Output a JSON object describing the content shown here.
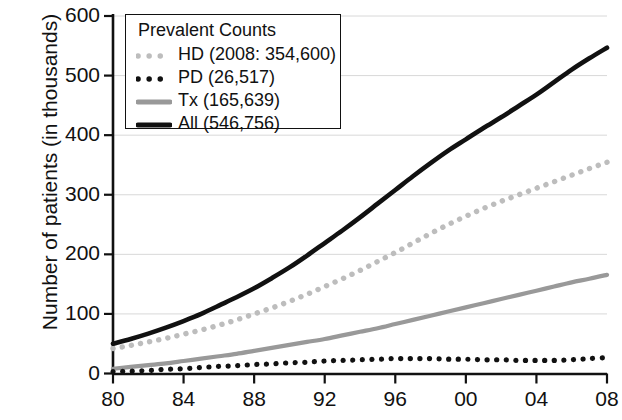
{
  "chart_data": {
    "type": "line",
    "title": "",
    "xlabel": "",
    "ylabel": "Number of patients (in thousands)",
    "xlim": [
      1980,
      2008
    ],
    "ylim": [
      0,
      600
    ],
    "xticks": [
      "80",
      "84",
      "88",
      "92",
      "96",
      "00",
      "04",
      "08"
    ],
    "xtick_values": [
      1980,
      1984,
      1988,
      1992,
      1996,
      2000,
      2004,
      2008
    ],
    "yticks": [
      "0",
      "100",
      "200",
      "300",
      "400",
      "500",
      "600"
    ],
    "ytick_values": [
      0,
      100,
      200,
      300,
      400,
      500,
      600
    ],
    "grid": "horizontal",
    "legend_position": "top-left",
    "legend_title": "Prevalent Counts",
    "x": [
      1980,
      1981,
      1982,
      1983,
      1984,
      1985,
      1986,
      1987,
      1988,
      1989,
      1990,
      1991,
      1992,
      1993,
      1994,
      1995,
      1996,
      1997,
      1998,
      1999,
      2000,
      2001,
      2002,
      2003,
      2004,
      2005,
      2006,
      2007,
      2008
    ],
    "series": [
      {
        "name": "HD",
        "label": "HD (2008: 354,600)",
        "style": "dotted",
        "color": "#bdbdbd",
        "final_value": 354.6,
        "values": [
          42,
          47,
          53,
          59,
          66,
          73,
          81,
          90,
          100,
          110,
          121,
          133,
          146,
          159,
          173,
          188,
          203,
          219,
          235,
          250,
          264,
          277,
          289,
          300,
          311,
          322,
          333,
          344,
          354.6
        ]
      },
      {
        "name": "PD",
        "label": "PD (26,517)",
        "style": "dotted",
        "color": "#111111",
        "final_value": 26.517,
        "values": [
          3,
          4,
          5,
          7,
          8,
          10,
          12,
          13,
          15,
          16,
          18,
          19,
          21,
          22,
          23,
          24,
          25,
          25,
          25,
          24,
          24,
          23,
          23,
          22,
          22,
          22,
          23,
          25,
          26.5
        ]
      },
      {
        "name": "Tx",
        "label": "Tx  (165,639)",
        "style": "solid",
        "color": "#999999",
        "final_value": 165.639,
        "values": [
          8,
          11,
          14,
          17,
          21,
          25,
          29,
          33,
          38,
          43,
          48,
          53,
          58,
          64,
          70,
          76,
          83,
          90,
          97,
          104,
          111,
          118,
          125,
          132,
          139,
          146,
          153,
          159,
          165.6
        ]
      },
      {
        "name": "All",
        "label": "All  (546,756)",
        "style": "solid",
        "color": "#111111",
        "final_value": 546.756,
        "values": [
          50,
          58,
          67,
          77,
          88,
          100,
          114,
          128,
          143,
          160,
          178,
          198,
          219,
          240,
          262,
          285,
          308,
          331,
          353,
          374,
          393,
          412,
          430,
          449,
          468,
          489,
          510,
          529,
          546.8
        ]
      }
    ]
  }
}
